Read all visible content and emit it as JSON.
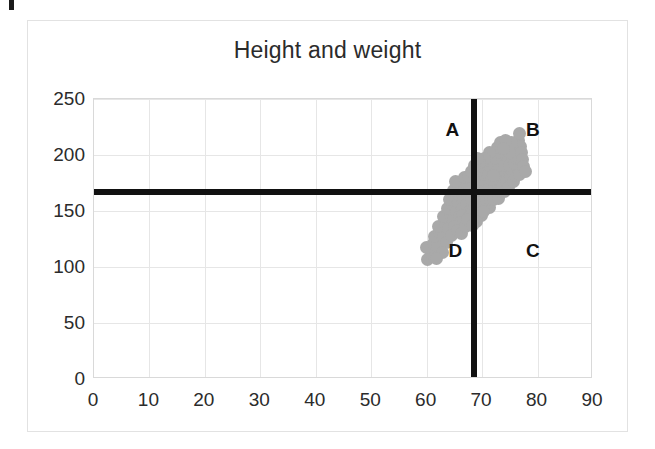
{
  "chart_data": {
    "type": "scatter",
    "title": "Height and weight",
    "xlabel": "",
    "ylabel": "",
    "xlim": [
      0,
      90
    ],
    "ylim": [
      0,
      250
    ],
    "xticks": [
      0,
      10,
      20,
      30,
      40,
      50,
      60,
      70,
      80,
      90
    ],
    "yticks": [
      0,
      50,
      100,
      150,
      200,
      250
    ],
    "grid": true,
    "legend": null,
    "marker_color": "#a9a9a9",
    "reference_lines": [
      {
        "orientation": "horizontal",
        "value": 167,
        "color": "#111111"
      },
      {
        "orientation": "vertical",
        "value": 68.5,
        "color": "#111111"
      }
    ],
    "annotations": [
      {
        "text": "A",
        "x": 64.5,
        "y": 222
      },
      {
        "text": "B",
        "x": 79.0,
        "y": 222
      },
      {
        "text": "C",
        "x": 79.0,
        "y": 114
      },
      {
        "text": "D",
        "x": 65.0,
        "y": 114
      }
    ],
    "points": [
      {
        "x": 60.2,
        "y": 107
      },
      {
        "x": 60.8,
        "y": 112
      },
      {
        "x": 60.0,
        "y": 117
      },
      {
        "x": 61.2,
        "y": 121
      },
      {
        "x": 62.0,
        "y": 118
      },
      {
        "x": 61.5,
        "y": 127
      },
      {
        "x": 62.4,
        "y": 131
      },
      {
        "x": 63.1,
        "y": 127
      },
      {
        "x": 62.2,
        "y": 136
      },
      {
        "x": 63.4,
        "y": 139
      },
      {
        "x": 64.0,
        "y": 134
      },
      {
        "x": 63.0,
        "y": 145
      },
      {
        "x": 64.3,
        "y": 147
      },
      {
        "x": 64.9,
        "y": 142
      },
      {
        "x": 63.8,
        "y": 152
      },
      {
        "x": 64.6,
        "y": 156
      },
      {
        "x": 65.4,
        "y": 150
      },
      {
        "x": 65.9,
        "y": 145
      },
      {
        "x": 64.2,
        "y": 160
      },
      {
        "x": 65.1,
        "y": 163
      },
      {
        "x": 65.8,
        "y": 158
      },
      {
        "x": 66.4,
        "y": 152
      },
      {
        "x": 66.0,
        "y": 164
      },
      {
        "x": 66.7,
        "y": 160
      },
      {
        "x": 65.6,
        "y": 170
      },
      {
        "x": 66.2,
        "y": 174
      },
      {
        "x": 64.8,
        "y": 168
      },
      {
        "x": 65.2,
        "y": 176
      },
      {
        "x": 66.9,
        "y": 168
      },
      {
        "x": 67.4,
        "y": 163
      },
      {
        "x": 67.1,
        "y": 156
      },
      {
        "x": 67.8,
        "y": 150
      },
      {
        "x": 66.5,
        "y": 146
      },
      {
        "x": 67.6,
        "y": 144
      },
      {
        "x": 68.2,
        "y": 149
      },
      {
        "x": 68.6,
        "y": 155
      },
      {
        "x": 68.0,
        "y": 160
      },
      {
        "x": 68.4,
        "y": 166
      },
      {
        "x": 67.9,
        "y": 171
      },
      {
        "x": 68.8,
        "y": 172
      },
      {
        "x": 69.3,
        "y": 166
      },
      {
        "x": 69.0,
        "y": 159
      },
      {
        "x": 69.5,
        "y": 152
      },
      {
        "x": 69.8,
        "y": 146
      },
      {
        "x": 68.9,
        "y": 141
      },
      {
        "x": 70.1,
        "y": 157
      },
      {
        "x": 70.4,
        "y": 164
      },
      {
        "x": 69.9,
        "y": 170
      },
      {
        "x": 70.6,
        "y": 172
      },
      {
        "x": 71.0,
        "y": 166
      },
      {
        "x": 70.8,
        "y": 159
      },
      {
        "x": 71.3,
        "y": 153
      },
      {
        "x": 70.2,
        "y": 150
      },
      {
        "x": 71.6,
        "y": 160
      },
      {
        "x": 71.9,
        "y": 167
      },
      {
        "x": 71.2,
        "y": 173
      },
      {
        "x": 72.2,
        "y": 172
      },
      {
        "x": 72.6,
        "y": 166
      },
      {
        "x": 72.0,
        "y": 160
      },
      {
        "x": 72.9,
        "y": 161
      },
      {
        "x": 73.3,
        "y": 167
      },
      {
        "x": 72.4,
        "y": 176
      },
      {
        "x": 73.0,
        "y": 178
      },
      {
        "x": 73.7,
        "y": 172
      },
      {
        "x": 74.1,
        "y": 167
      },
      {
        "x": 73.5,
        "y": 182
      },
      {
        "x": 74.4,
        "y": 176
      },
      {
        "x": 74.8,
        "y": 171
      },
      {
        "x": 74.0,
        "y": 186
      },
      {
        "x": 75.1,
        "y": 181
      },
      {
        "x": 75.6,
        "y": 176
      },
      {
        "x": 76.0,
        "y": 182
      },
      {
        "x": 75.2,
        "y": 188
      },
      {
        "x": 76.4,
        "y": 188
      },
      {
        "x": 76.8,
        "y": 183
      },
      {
        "x": 69.7,
        "y": 178
      },
      {
        "x": 70.3,
        "y": 183
      },
      {
        "x": 69.4,
        "y": 186
      },
      {
        "x": 70.0,
        "y": 190
      },
      {
        "x": 70.7,
        "y": 188
      },
      {
        "x": 71.1,
        "y": 183
      },
      {
        "x": 71.5,
        "y": 190
      },
      {
        "x": 70.9,
        "y": 195
      },
      {
        "x": 71.8,
        "y": 196
      },
      {
        "x": 72.3,
        "y": 191
      },
      {
        "x": 72.7,
        "y": 186
      },
      {
        "x": 73.1,
        "y": 191
      },
      {
        "x": 72.5,
        "y": 197
      },
      {
        "x": 73.6,
        "y": 196
      },
      {
        "x": 74.0,
        "y": 191
      },
      {
        "x": 73.2,
        "y": 202
      },
      {
        "x": 74.3,
        "y": 201
      },
      {
        "x": 74.7,
        "y": 196
      },
      {
        "x": 75.0,
        "y": 191
      },
      {
        "x": 75.4,
        "y": 197
      },
      {
        "x": 75.8,
        "y": 192
      },
      {
        "x": 76.2,
        "y": 197
      },
      {
        "x": 74.5,
        "y": 206
      },
      {
        "x": 75.6,
        "y": 206
      },
      {
        "x": 72.8,
        "y": 207
      },
      {
        "x": 73.4,
        "y": 211
      },
      {
        "x": 76.1,
        "y": 203
      },
      {
        "x": 76.6,
        "y": 198
      },
      {
        "x": 75.9,
        "y": 210
      },
      {
        "x": 76.5,
        "y": 213
      },
      {
        "x": 76.9,
        "y": 208
      },
      {
        "x": 77.1,
        "y": 202
      },
      {
        "x": 77.3,
        "y": 196
      },
      {
        "x": 76.7,
        "y": 219
      },
      {
        "x": 77.5,
        "y": 190
      },
      {
        "x": 77.9,
        "y": 185
      },
      {
        "x": 71.4,
        "y": 202
      },
      {
        "x": 70.5,
        "y": 197
      },
      {
        "x": 69.6,
        "y": 193
      },
      {
        "x": 68.5,
        "y": 178
      },
      {
        "x": 67.2,
        "y": 175
      },
      {
        "x": 66.8,
        "y": 180
      },
      {
        "x": 67.6,
        "y": 181
      },
      {
        "x": 68.1,
        "y": 185
      },
      {
        "x": 68.7,
        "y": 191
      },
      {
        "x": 69.1,
        "y": 197
      },
      {
        "x": 74.9,
        "y": 202
      },
      {
        "x": 75.3,
        "y": 211
      },
      {
        "x": 74.2,
        "y": 213
      },
      {
        "x": 73.8,
        "y": 206
      },
      {
        "x": 71.7,
        "y": 178
      },
      {
        "x": 72.1,
        "y": 182
      },
      {
        "x": 66.1,
        "y": 140
      },
      {
        "x": 65.0,
        "y": 136
      },
      {
        "x": 63.6,
        "y": 122
      },
      {
        "x": 62.8,
        "y": 113
      },
      {
        "x": 61.8,
        "y": 108
      },
      {
        "x": 64.5,
        "y": 128
      },
      {
        "x": 65.5,
        "y": 133
      },
      {
        "x": 66.3,
        "y": 130
      },
      {
        "x": 67.0,
        "y": 136
      },
      {
        "x": 67.3,
        "y": 142
      },
      {
        "x": 68.3,
        "y": 137
      }
    ]
  },
  "chart": {
    "title": "Height and weight",
    "quadrant_labels": {
      "a": "A",
      "b": "B",
      "c": "C",
      "d": "D"
    },
    "y_axis": {
      "ticks": [
        "250",
        "200",
        "150",
        "100",
        "50",
        "0"
      ]
    },
    "x_axis": {
      "ticks": [
        "0",
        "10",
        "20",
        "30",
        "40",
        "50",
        "60",
        "70",
        "80",
        "90"
      ]
    }
  }
}
